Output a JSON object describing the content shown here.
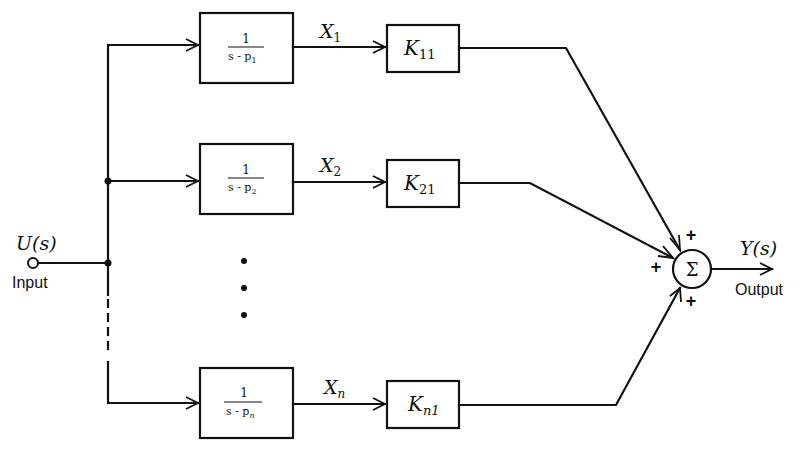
{
  "diagram": {
    "type": "block-diagram",
    "input": {
      "signal": "U(s)",
      "label": "Input"
    },
    "output": {
      "signal": "Y(s)",
      "label": "Output"
    },
    "summing_junction": {
      "symbol": "Σ",
      "signs": [
        "+",
        "+",
        "+"
      ]
    },
    "branches": [
      {
        "pole_block": {
          "numerator": "1",
          "denominator_prefix": "s - p",
          "subscript": "1"
        },
        "state": {
          "base": "X",
          "subscript": "1"
        },
        "gain_block": {
          "base": "K",
          "subscript": "11"
        }
      },
      {
        "pole_block": {
          "numerator": "1",
          "denominator_prefix": "s - p",
          "subscript": "2"
        },
        "state": {
          "base": "X",
          "subscript": "2"
        },
        "gain_block": {
          "base": "K",
          "subscript": "21"
        }
      },
      {
        "pole_block": {
          "numerator": "1",
          "denominator_prefix": "s - p",
          "subscript": "n"
        },
        "state": {
          "base": "X",
          "subscript": "n"
        },
        "gain_block": {
          "base": "K",
          "subscript": "n1"
        }
      }
    ],
    "ellipsis": "vertical dots (branches 3 … n-1 omitted)"
  }
}
